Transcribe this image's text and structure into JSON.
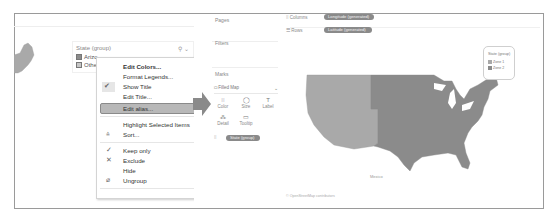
{
  "left_panel": {
    "legend": {
      "title": "State (group)",
      "tools": "⚲ ⌄",
      "items": [
        {
          "label": "Arizo",
          "color": "#8c8c8c"
        },
        {
          "label": "Other",
          "color": "#c6c6c6"
        }
      ]
    },
    "context_menu": {
      "items": [
        {
          "label": "Edit Colors...",
          "bold": true,
          "icon": ""
        },
        {
          "label": "Format Legends...",
          "bold": false,
          "icon": ""
        },
        {
          "label": "Show Title",
          "bold": false,
          "icon": "✔",
          "checked": true
        },
        {
          "label": "Edit Title...",
          "bold": false,
          "icon": ""
        },
        {
          "label": "Edit alias...",
          "bold": false,
          "icon": "",
          "highlighted": true
        },
        {
          "label": "Highlight Selected Items",
          "bold": false,
          "icon": ""
        },
        {
          "label": "Sort...",
          "bold": false,
          "icon": "sort-icon"
        },
        {
          "label": "Keep only",
          "bold": false,
          "icon": "check-icon"
        },
        {
          "label": "Exclude",
          "bold": false,
          "icon": "x-icon"
        },
        {
          "label": "Hide",
          "bold": false,
          "icon": ""
        },
        {
          "label": "Ungroup",
          "bold": false,
          "icon": "ungroup-icon"
        }
      ]
    }
  },
  "right_panel": {
    "cards": {
      "pages": "Pages",
      "filters": "Filters",
      "marks": "Marks"
    },
    "mark_type": "Filled Map",
    "mark_buttons": [
      {
        "label": "Color",
        "glyph": "⁞⁞"
      },
      {
        "label": "Size",
        "glyph": "◯"
      },
      {
        "label": "Label",
        "glyph": "T"
      },
      {
        "label": "Detail",
        "glyph": "⁂"
      },
      {
        "label": "Tooltip",
        "glyph": "▭"
      }
    ],
    "marks_pill": "State (group)",
    "shelves": {
      "columns_label": "Columns",
      "columns_pill": "Longitude (generated)",
      "rows_label": "Rows",
      "rows_pill": "Latitude (generated)"
    },
    "map": {
      "zone1_color": "#a9a9a9",
      "zone2_color": "#8b8b8b",
      "mexico_label": "Mexico",
      "copyright": "© OpenStreetMap contributors"
    },
    "legend": {
      "title": "State (group)",
      "items": [
        {
          "label": "Zone 1",
          "color": "#a9a9a9"
        },
        {
          "label": "Zone 2",
          "color": "#8b8b8b"
        }
      ]
    }
  }
}
